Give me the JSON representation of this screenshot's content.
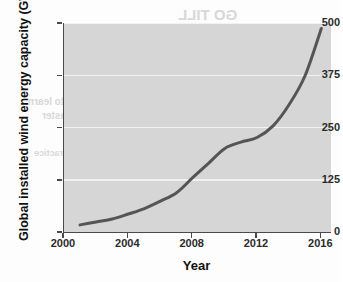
{
  "figure": {
    "background_color": "#fdfdfd",
    "plot_background_color": "#d6d6d6",
    "axis_color": "#4a4a4a",
    "gridline_color": "#f2f2f2"
  },
  "ghost_text": {
    "line_1": "GO TILL",
    "line_2": "MATH",
    "line_3": "to learn",
    "line_4": "faster",
    "line_5": "practice"
  },
  "chart_data": {
    "type": "line",
    "title": "",
    "xlabel": "Year",
    "ylabel": "Global installed wind energy capacity (GW)",
    "line_color": "#555555",
    "line_width": 3,
    "grid": true,
    "grid_axis": "y",
    "legend": false,
    "legend_position": "none",
    "xlim": [
      2000,
      2016.6
    ],
    "ylim": [
      0,
      500
    ],
    "xticks": [
      2000,
      2004,
      2008,
      2012,
      2016
    ],
    "xtick_labels": [
      "2000",
      "2004",
      "2008",
      "2012",
      "2016"
    ],
    "yticks": [
      0,
      125,
      250,
      375,
      500
    ],
    "ytick_labels": [
      "0",
      "125",
      "250",
      "375",
      "500"
    ],
    "series": [
      {
        "name": "Global installed wind energy capacity",
        "x": [
          2001,
          2002,
          2003,
          2004,
          2005,
          2006,
          2007,
          2008,
          2009,
          2010,
          2011,
          2012,
          2013,
          2014,
          2015,
          2016
        ],
        "values": [
          17,
          24,
          31,
          43,
          56,
          74,
          94,
          130,
          165,
          200,
          215,
          226,
          254,
          305,
          375,
          487
        ]
      }
    ]
  }
}
